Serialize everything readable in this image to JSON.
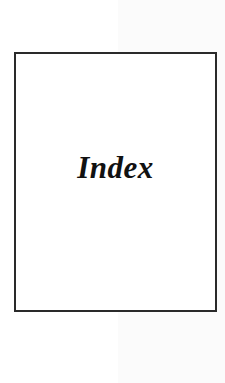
{
  "page": {
    "title": "Index"
  }
}
